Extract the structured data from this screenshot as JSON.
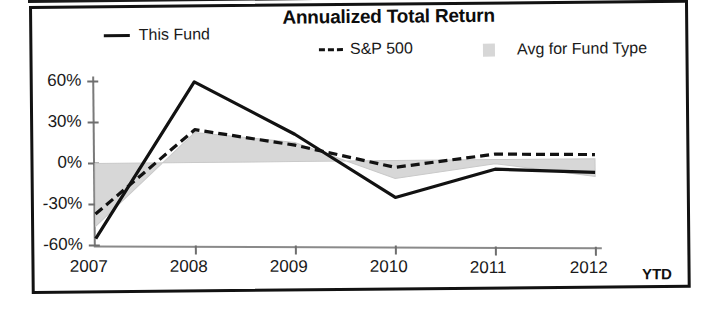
{
  "chart_data": {
    "type": "line",
    "title": "Annualized Total Return",
    "xlabel": "",
    "ylabel": "",
    "x_axis_note": "YTD",
    "categories": [
      "2007",
      "2008",
      "2009",
      "2010",
      "2011",
      "2012"
    ],
    "xlim": [
      2007,
      2012
    ],
    "ylim": [
      -60,
      60
    ],
    "ytick_labels": [
      "60%",
      "30%",
      "0%",
      "-30%",
      "-60%"
    ],
    "ytick_values": [
      60,
      30,
      0,
      -30,
      -60
    ],
    "grid": false,
    "legend_position": "top",
    "series": [
      {
        "name": "This Fund",
        "style": "solid",
        "color": "#121212",
        "values": [
          -55,
          59,
          20,
          -27,
          -7,
          -10
        ]
      },
      {
        "name": "S&P 500",
        "style": "dashed",
        "color": "#121212",
        "values": [
          -37,
          24,
          12,
          -5,
          4,
          3
        ]
      },
      {
        "name": "Avg for Fund Type",
        "style": "shaded-band",
        "color": "#d7d7d7",
        "values": [
          -46,
          22,
          14,
          -13,
          -3,
          -13
        ]
      }
    ]
  },
  "chart": {
    "title": "Annualized Total Return",
    "ytd_label": "YTD",
    "legend": [
      {
        "label": "This Fund",
        "marker": "solid-line-marker"
      },
      {
        "label": "S&P 500",
        "marker": "dashed-line-marker"
      },
      {
        "label": "Avg for Fund Type",
        "marker": "gray-swatch-marker"
      }
    ],
    "y_labels": [
      "60%",
      "30%",
      "0%",
      "-30%",
      "-60%"
    ],
    "x_labels": [
      "2007",
      "2008",
      "2009",
      "2010",
      "2011",
      "2012"
    ]
  },
  "colors": {
    "line": "#121212",
    "band": "#d7d7d7",
    "axis": "#7a7a7a",
    "frame": "#121212",
    "background": "#ffffff"
  }
}
